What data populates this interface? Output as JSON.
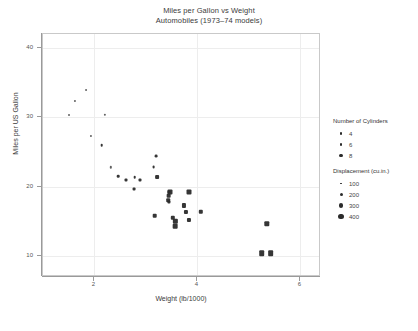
{
  "title": {
    "line1": "Miles per Gallon vs Weight",
    "line2": "Automobiles (1973–74 models)"
  },
  "axes": {
    "xlabel": "Weight (lb/1000)",
    "ylabel": "Miles per US Gallon",
    "xticks": [
      2,
      4,
      6
    ],
    "yticks": [
      10,
      20,
      30,
      40
    ],
    "xlim": [
      1.0,
      6.4
    ],
    "ylim": [
      7.0,
      42.0
    ]
  },
  "legends": [
    {
      "name": "cylinders",
      "title": "Number of Cylinders",
      "entries": [
        {
          "label": "4",
          "size": 2.2
        },
        {
          "label": "6",
          "size": 2.8
        },
        {
          "label": "8",
          "size": 3.4
        }
      ]
    },
    {
      "name": "displacement",
      "title": "Displacement (cu.in.)",
      "entries": [
        {
          "label": "100",
          "size": 1.8
        },
        {
          "label": "200",
          "size": 3.0
        },
        {
          "label": "300",
          "size": 4.2
        },
        {
          "label": "400",
          "size": 5.6
        }
      ]
    }
  ],
  "chart_data": {
    "type": "scatter",
    "title": "Miles per Gallon vs Weight",
    "subtitle": "Automobiles (1973–74 models)",
    "xlabel": "Weight (lb/1000)",
    "ylabel": "Miles per US Gallon",
    "xlim": [
      1.0,
      6.4
    ],
    "ylim": [
      7.0,
      42.0
    ],
    "grid": true,
    "legend_position": "right",
    "size_encoding": "displacement (cu.in.)",
    "marker_encoding": "number of cylinders",
    "x": "weight",
    "y": "mpg",
    "points": [
      {
        "x": 1.513,
        "y": 30.4,
        "cyl": 4,
        "disp": 75.7,
        "size": 2.0
      },
      {
        "x": 1.615,
        "y": 32.4,
        "cyl": 4,
        "disp": 78.7,
        "size": 2.1
      },
      {
        "x": 1.835,
        "y": 33.9,
        "cyl": 4,
        "disp": 71.1,
        "size": 1.9
      },
      {
        "x": 1.935,
        "y": 27.3,
        "cyl": 4,
        "disp": 79.0,
        "size": 2.1
      },
      {
        "x": 2.14,
        "y": 26.0,
        "cyl": 4,
        "disp": 120.3,
        "size": 2.6
      },
      {
        "x": 2.2,
        "y": 30.4,
        "cyl": 4,
        "disp": 95.1,
        "size": 2.3
      },
      {
        "x": 2.32,
        "y": 22.8,
        "cyl": 4,
        "disp": 108.0,
        "size": 2.4
      },
      {
        "x": 2.465,
        "y": 21.5,
        "cyl": 4,
        "disp": 120.1,
        "size": 2.6
      },
      {
        "x": 2.62,
        "y": 21.0,
        "cyl": 6,
        "disp": 160.0,
        "size": 3.0
      },
      {
        "x": 2.77,
        "y": 19.7,
        "cyl": 6,
        "disp": 145.0,
        "size": 2.9
      },
      {
        "x": 2.78,
        "y": 21.4,
        "cyl": 4,
        "disp": 121.0,
        "size": 2.6
      },
      {
        "x": 2.875,
        "y": 21.0,
        "cyl": 6,
        "disp": 160.0,
        "size": 3.0
      },
      {
        "x": 3.15,
        "y": 22.8,
        "cyl": 4,
        "disp": 140.8,
        "size": 2.8
      },
      {
        "x": 3.17,
        "y": 15.8,
        "cyl": 8,
        "disp": 351.0,
        "size": 4.6
      },
      {
        "x": 3.19,
        "y": 24.4,
        "cyl": 4,
        "disp": 146.7,
        "size": 2.8
      },
      {
        "x": 3.215,
        "y": 21.4,
        "cyl": 6,
        "disp": 258.0,
        "size": 3.8
      },
      {
        "x": 3.435,
        "y": 18.1,
        "cyl": 6,
        "disp": 225.0,
        "size": 3.6
      },
      {
        "x": 3.44,
        "y": 19.2,
        "cyl": 6,
        "disp": 167.6,
        "size": 3.1
      },
      {
        "x": 3.44,
        "y": 17.8,
        "cyl": 6,
        "disp": 167.6,
        "size": 3.1
      },
      {
        "x": 3.44,
        "y": 18.7,
        "cyl": 8,
        "disp": 360.0,
        "size": 4.7
      },
      {
        "x": 3.46,
        "y": 19.2,
        "cyl": 8,
        "disp": 400.0,
        "size": 5.0
      },
      {
        "x": 3.52,
        "y": 15.5,
        "cyl": 8,
        "disp": 318.0,
        "size": 4.4
      },
      {
        "x": 3.57,
        "y": 14.3,
        "cyl": 8,
        "disp": 360.0,
        "size": 4.7
      },
      {
        "x": 3.57,
        "y": 15.0,
        "cyl": 8,
        "disp": 301.0,
        "size": 4.3
      },
      {
        "x": 3.73,
        "y": 17.3,
        "cyl": 8,
        "disp": 275.8,
        "size": 4.1
      },
      {
        "x": 3.78,
        "y": 16.4,
        "cyl": 8,
        "disp": 275.8,
        "size": 4.1
      },
      {
        "x": 3.84,
        "y": 15.2,
        "cyl": 8,
        "disp": 275.8,
        "size": 4.1
      },
      {
        "x": 3.845,
        "y": 19.2,
        "cyl": 8,
        "disp": 400.0,
        "size": 5.0
      },
      {
        "x": 4.07,
        "y": 16.4,
        "cyl": 8,
        "disp": 318.0,
        "size": 4.4
      },
      {
        "x": 5.25,
        "y": 10.4,
        "cyl": 8,
        "disp": 459.0,
        "size": 5.6
      },
      {
        "x": 5.345,
        "y": 14.7,
        "cyl": 8,
        "disp": 440.0,
        "size": 5.4
      },
      {
        "x": 5.424,
        "y": 10.4,
        "cyl": 8,
        "disp": 472.0,
        "size": 5.7
      }
    ]
  }
}
